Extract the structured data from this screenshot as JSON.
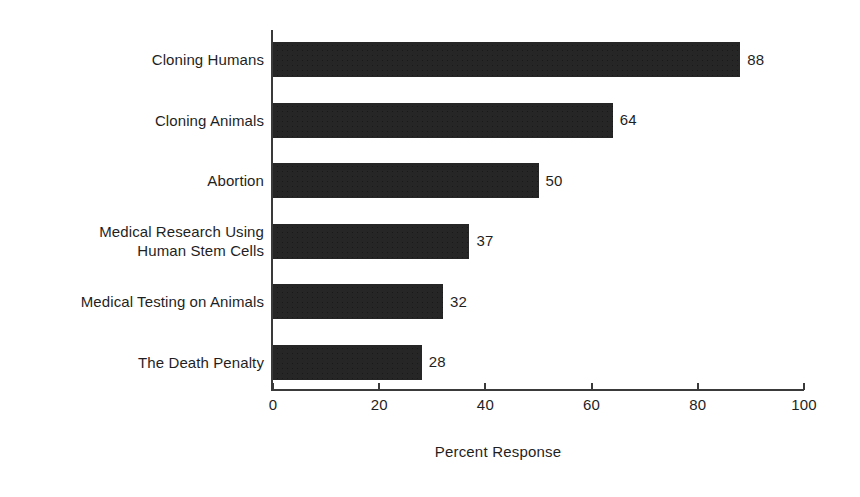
{
  "chart_data": {
    "type": "bar",
    "orientation": "horizontal",
    "title": "",
    "xlabel": "Percent Response",
    "ylabel": "",
    "categories": [
      "Cloning Humans",
      "Cloning Animals",
      "Abortion",
      "Medical Research Using\nHuman Stem Cells",
      "Medical Testing on Animals",
      "The Death Penalty"
    ],
    "values": [
      88,
      64,
      50,
      37,
      32,
      28
    ],
    "value_labels": [
      "88",
      "64",
      "50",
      "37",
      "32",
      "28"
    ],
    "xlim": [
      0,
      100
    ],
    "xticks": [
      0,
      20,
      40,
      60,
      80,
      100
    ],
    "xtick_labels": [
      "0",
      "20",
      "40",
      "60",
      "80",
      "100"
    ],
    "grid": false,
    "legend": false,
    "bar_color": "#262626",
    "axis_color": "#3a3a3a",
    "text_color": "#1f1f1f",
    "background": "#ffffff"
  }
}
